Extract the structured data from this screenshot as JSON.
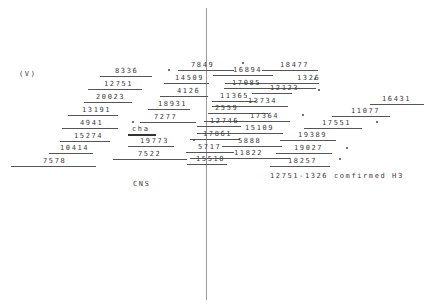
{
  "diagram": {
    "corner_label": "(V)",
    "bottom_label": "CNS",
    "note": "12751-1326 comfirmed H3",
    "axis_color": "#9a9a9a",
    "items": [
      {
        "label": "8336",
        "x": 115,
        "y": 67,
        "lx": 100,
        "lw": 52
      },
      {
        "label": "12751",
        "x": 104,
        "y": 80,
        "lx": 88,
        "lw": 54
      },
      {
        "label": "20023",
        "x": 96,
        "y": 93,
        "lx": 84,
        "lw": 48
      },
      {
        "label": "13191",
        "x": 82,
        "y": 106,
        "lx": 68,
        "lw": 50
      },
      {
        "label": "4941",
        "x": 80,
        "y": 119,
        "lx": 62,
        "lw": 56
      },
      {
        "label": "15274",
        "x": 74,
        "y": 132,
        "lx": 60,
        "lw": 50
      },
      {
        "label": "10414",
        "x": 60,
        "y": 144,
        "lx": 49,
        "lw": 44
      },
      {
        "label": "7578",
        "x": 43,
        "y": 157,
        "lx": 11,
        "lw": 85
      },
      {
        "label": "7849",
        "x": 191,
        "y": 61,
        "lx": 178,
        "lw": 56
      },
      {
        "label": "14509",
        "x": 175,
        "y": 74,
        "lx": 164,
        "lw": 45
      },
      {
        "label": "4126",
        "x": 177,
        "y": 87,
        "lx": 160,
        "lw": 48
      },
      {
        "label": "18931",
        "x": 158,
        "y": 100,
        "lx": 148,
        "lw": 42
      },
      {
        "label": "7277",
        "x": 154,
        "y": 113,
        "lx": 140,
        "lw": 56
      },
      {
        "label": "cha",
        "x": 132,
        "y": 125,
        "lx": 128,
        "lw": 28,
        "thick": true
      },
      {
        "label": "19773",
        "x": 140,
        "y": 137,
        "lx": 128,
        "lw": 46
      },
      {
        "label": "7522",
        "x": 138,
        "y": 150,
        "lx": 113,
        "lw": 74
      },
      {
        "label": "16894",
        "x": 233,
        "y": 66,
        "lx": 213,
        "lw": 60
      },
      {
        "label": "18477",
        "x": 280,
        "y": 61,
        "lx": 262,
        "lw": 56
      },
      {
        "label": "1326",
        "x": 297,
        "y": 74,
        "lx": 225,
        "lw": 94
      },
      {
        "label": "17085",
        "x": 232,
        "y": 79,
        "lx": 224,
        "lw": 92
      },
      {
        "label": "12123",
        "x": 270,
        "y": 84,
        "lx": 252,
        "lw": 40
      },
      {
        "label": "11365",
        "x": 220,
        "y": 92,
        "lx": 212,
        "lw": 44
      },
      {
        "label": "13734",
        "x": 248,
        "y": 97,
        "lx": 212,
        "lw": 76
      },
      {
        "label": "2559",
        "x": 215,
        "y": 104,
        "lx": 208,
        "lw": 60
      },
      {
        "label": "17364",
        "x": 250,
        "y": 112,
        "lx": 204,
        "lw": 86
      },
      {
        "label": "12746",
        "x": 210,
        "y": 117,
        "lx": 197,
        "lw": 44
      },
      {
        "label": "15109",
        "x": 245,
        "y": 124,
        "lx": 197,
        "lw": 86
      },
      {
        "label": "17861",
        "x": 203,
        "y": 130,
        "lx": 190,
        "lw": 50
      },
      {
        "label": "5888",
        "x": 238,
        "y": 137,
        "lx": 222,
        "lw": 60
      },
      {
        "label": "5717",
        "x": 198,
        "y": 143,
        "lx": 186,
        "lw": 48
      },
      {
        "label": "11822",
        "x": 234,
        "y": 149,
        "lx": 190,
        "lw": 100
      },
      {
        "label": "15510",
        "x": 196,
        "y": 155,
        "lx": 187,
        "lw": 40
      },
      {
        "label": "16431",
        "x": 382,
        "y": 95,
        "lx": 370,
        "lw": 54
      },
      {
        "label": "11077",
        "x": 351,
        "y": 107,
        "lx": 332,
        "lw": 58
      },
      {
        "label": "17551",
        "x": 322,
        "y": 119,
        "lx": 304,
        "lw": 58
      },
      {
        "label": "19389",
        "x": 298,
        "y": 131,
        "lx": 280,
        "lw": 56
      },
      {
        "label": "19027",
        "x": 294,
        "y": 144,
        "lx": 276,
        "lw": 56
      },
      {
        "label": "18257",
        "x": 288,
        "y": 157,
        "lx": 270,
        "lw": 60
      }
    ],
    "dots": [
      {
        "x": 168,
        "y": 69
      },
      {
        "x": 242,
        "y": 62
      },
      {
        "x": 314,
        "y": 78
      },
      {
        "x": 318,
        "y": 89
      },
      {
        "x": 302,
        "y": 114
      },
      {
        "x": 376,
        "y": 121
      },
      {
        "x": 132,
        "y": 121
      },
      {
        "x": 193,
        "y": 139
      },
      {
        "x": 346,
        "y": 147
      },
      {
        "x": 339,
        "y": 158
      }
    ]
  }
}
